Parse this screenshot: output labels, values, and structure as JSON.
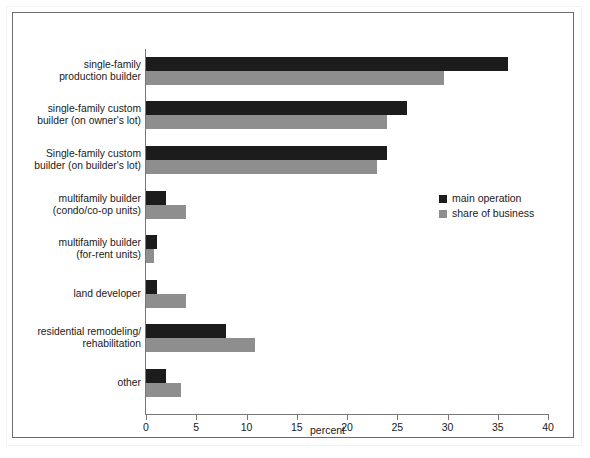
{
  "chart_data": {
    "type": "bar",
    "orientation": "horizontal",
    "title": "",
    "xlabel": "percent",
    "ylabel": "",
    "xlim": [
      0,
      40
    ],
    "xticks": [
      0,
      5,
      10,
      15,
      20,
      25,
      30,
      35,
      40
    ],
    "xtick_labels": [
      "0",
      "5",
      "10",
      "15",
      "20",
      "25",
      "30",
      "35",
      "40"
    ],
    "grid": false,
    "legend_position": "center-right",
    "categories": [
      "single-family\nproduction builder",
      "single-family custom\nbuilder (on owner's lot)",
      "Single-family custom\nbuilder (on builder's lot)",
      "multifamily builder\n(condo/co-op units)",
      "multifamily builder\n(for-rent units)",
      "land developer",
      "residential remodeling/\nrehabilitation",
      "other"
    ],
    "series": [
      {
        "name": "main operation",
        "color": "#1c1c1c",
        "values": [
          36.0,
          26.0,
          24.0,
          2.0,
          1.1,
          1.1,
          8.0,
          2.0
        ]
      },
      {
        "name": "share of business",
        "color": "#8e8e8e",
        "values": [
          29.7,
          24.0,
          23.0,
          4.0,
          0.8,
          4.0,
          10.8,
          3.5
        ]
      }
    ]
  },
  "categories_display": [
    [
      "single-family",
      "production builder"
    ],
    [
      "single-family custom",
      "builder (on owner's lot)"
    ],
    [
      "Single-family custom",
      "builder (on builder's lot)"
    ],
    [
      "multifamily builder",
      "(condo/co-op units)"
    ],
    [
      "multifamily builder",
      "(for-rent units)"
    ],
    [
      "land developer",
      ""
    ],
    [
      "residential remodeling/",
      "rehabilitation"
    ],
    [
      "other",
      ""
    ]
  ],
  "legend": {
    "items": [
      {
        "label": "main operation",
        "color": "#1c1c1c"
      },
      {
        "label": "share of business",
        "color": "#8e8e8e"
      }
    ]
  },
  "axis": {
    "x_title": "percent",
    "tick_labels": [
      "0",
      "5",
      "10",
      "15",
      "20",
      "25",
      "30",
      "35",
      "40"
    ]
  }
}
